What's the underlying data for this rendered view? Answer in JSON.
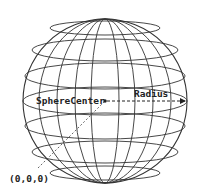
{
  "diagram": {
    "labels": {
      "center": "SphereCenter",
      "radius": "Radius",
      "origin": "(0,0,0)"
    },
    "colors": {
      "line": "#333333",
      "background": "#ffffff"
    },
    "sphere": {
      "cx": 105,
      "cy": 101,
      "r": 82
    },
    "latitudes": [
      {
        "cy": 28,
        "rx": 55,
        "ry": 7
      },
      {
        "cy": 50,
        "rx": 73,
        "ry": 11
      },
      {
        "cy": 76,
        "rx": 80,
        "ry": 13
      },
      {
        "cy": 101,
        "rx": 82,
        "ry": 14
      },
      {
        "cy": 126,
        "rx": 80,
        "ry": 13
      },
      {
        "cy": 152,
        "rx": 73,
        "ry": 11
      },
      {
        "cy": 173,
        "rx": 55,
        "ry": 7
      }
    ],
    "meridians": [
      {
        "rx": 14
      },
      {
        "rx": 30
      },
      {
        "rx": 48
      },
      {
        "rx": 66
      }
    ]
  }
}
